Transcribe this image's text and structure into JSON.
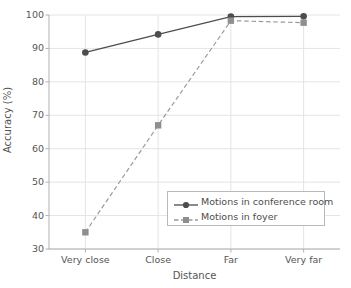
{
  "chart_data": {
    "type": "line",
    "title": "",
    "xlabel": "Distance",
    "ylabel": "Accuracy (%)",
    "categories": [
      "Very close",
      "Close",
      "Far",
      "Very far"
    ],
    "ylim": [
      30,
      100
    ],
    "yticks": [
      30,
      40,
      50,
      60,
      70,
      80,
      90,
      100
    ],
    "ytick_labels": [
      "30",
      "40",
      "50",
      "60",
      "70",
      "80",
      "90",
      "100"
    ],
    "grid": true,
    "legend_position": "lower right",
    "series": [
      {
        "name": "Motions in conference room",
        "values": [
          88.8,
          94.2,
          99.5,
          99.6
        ],
        "color": "#4d4d4d",
        "linestyle": "solid",
        "marker": "circle"
      },
      {
        "name": "Motions in foyer",
        "values": [
          35.0,
          67.0,
          98.3,
          97.7
        ],
        "color": "#9a9a9a",
        "linestyle": "dashed",
        "marker": "square"
      }
    ]
  },
  "axes": {
    "xlabel": "Distance",
    "ylabel": "Accuracy (%)",
    "xtick_labels": [
      "Very close",
      "Close",
      "Far",
      "Very far"
    ],
    "ytick_labels": [
      "30",
      "40",
      "50",
      "60",
      "70",
      "80",
      "90",
      "100"
    ]
  },
  "legend": {
    "entries": [
      {
        "label": "Motions in conference room"
      },
      {
        "label": "Motions in foyer"
      }
    ]
  },
  "colors": {
    "series1": "#4d4d4d",
    "series2": "#9a9a9a",
    "grid": "#e4e4e4",
    "axis": "#b0b0b0",
    "text": "#555555",
    "background": "#ffffff"
  }
}
